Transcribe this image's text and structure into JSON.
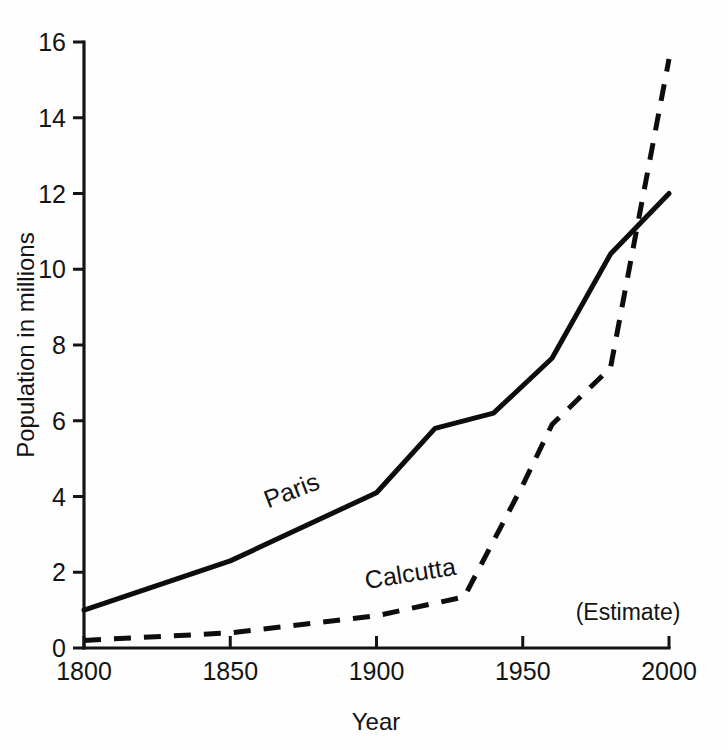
{
  "chart_data": {
    "type": "line",
    "title": "",
    "xlabel": "Year",
    "ylabel": "Population in millions",
    "xlim": [
      1800,
      2000
    ],
    "ylim": [
      0,
      16
    ],
    "grid": false,
    "legend_position": "inline-labels",
    "x_ticks": [
      "1800",
      "1850",
      "1900",
      "1950",
      "2000"
    ],
    "x_tick_values": [
      1800,
      1850,
      1900,
      1950,
      2000
    ],
    "y_ticks": [
      "0",
      "2",
      "4",
      "6",
      "8",
      "10",
      "12",
      "14",
      "16"
    ],
    "y_tick_values": [
      0,
      2,
      4,
      6,
      8,
      10,
      12,
      14,
      16
    ],
    "annotations": [
      {
        "text": "(Estimate)",
        "x": 1986,
        "y": 0.75
      }
    ],
    "series": [
      {
        "name": "Paris",
        "style": "solid",
        "label_x": 1872,
        "label_y": 3.95,
        "label_rotation": -21,
        "x": [
          1800,
          1850,
          1900,
          1920,
          1940,
          1960,
          1980,
          2000
        ],
        "values": [
          1.0,
          2.3,
          4.1,
          5.8,
          6.2,
          7.65,
          10.4,
          12.0
        ]
      },
      {
        "name": "Calcutta",
        "style": "dashed",
        "label_x": 1912,
        "label_y": 1.75,
        "label_rotation": -9,
        "x": [
          1800,
          1850,
          1900,
          1930,
          1950,
          1960,
          1980,
          2000
        ],
        "values": [
          0.2,
          0.4,
          0.85,
          1.35,
          4.3,
          5.9,
          7.4,
          15.55
        ]
      }
    ]
  }
}
